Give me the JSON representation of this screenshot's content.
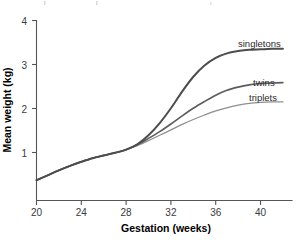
{
  "chart_data": {
    "type": "line",
    "title": "",
    "xlabel": "Gestation (weeks)",
    "ylabel": "Mean weight (kg)",
    "xlim": [
      20,
      42.5
    ],
    "ylim": [
      0,
      4
    ],
    "xticks": [
      20,
      24,
      28,
      32,
      36,
      40
    ],
    "yticks": [
      1,
      2,
      3,
      4
    ],
    "xtick_labels": [
      "20",
      "24",
      "28",
      "32",
      "36",
      "40"
    ],
    "ytick_labels": [
      "1",
      "2",
      "3",
      "4"
    ],
    "grid": false,
    "legend_position": "inline-right",
    "x": [
      20,
      21,
      22,
      23,
      24,
      25,
      26,
      27,
      28,
      29,
      30,
      31,
      32,
      33,
      34,
      35,
      36,
      37,
      38,
      39,
      40,
      41,
      42
    ],
    "series": [
      {
        "name": "singletons",
        "label": "singletons",
        "color": "#4d4d4d",
        "width": 2.0,
        "values": [
          0.45,
          0.56,
          0.67,
          0.77,
          0.86,
          0.94,
          1.0,
          1.06,
          1.13,
          1.25,
          1.45,
          1.72,
          2.05,
          2.42,
          2.75,
          3.0,
          3.17,
          3.27,
          3.32,
          3.35,
          3.36,
          3.37,
          3.37
        ]
      },
      {
        "name": "twins",
        "label": "twins",
        "color": "#5c5c5c",
        "width": 1.6,
        "values": [
          0.45,
          0.56,
          0.67,
          0.77,
          0.86,
          0.94,
          1.0,
          1.06,
          1.13,
          1.24,
          1.38,
          1.53,
          1.7,
          1.88,
          2.05,
          2.2,
          2.34,
          2.45,
          2.52,
          2.57,
          2.6,
          2.61,
          2.62
        ]
      },
      {
        "name": "triplets",
        "label": "triplets",
        "color": "#8f8f8f",
        "width": 1.3,
        "values": [
          0.45,
          0.56,
          0.67,
          0.77,
          0.86,
          0.94,
          1.0,
          1.06,
          1.13,
          1.22,
          1.33,
          1.45,
          1.57,
          1.69,
          1.8,
          1.9,
          1.99,
          2.06,
          2.12,
          2.16,
          2.18,
          2.19,
          2.19
        ]
      }
    ]
  },
  "axis": {
    "x_title": "Gestation (weeks)",
    "y_title": "Mean weight (kg)"
  },
  "labels": {
    "singletons": "singletons",
    "twins": "twins",
    "triplets": "triplets"
  },
  "ticks": {
    "x0": "20",
    "x1": "24",
    "x2": "28",
    "x3": "32",
    "x4": "36",
    "x5": "40",
    "y1": "1",
    "y2": "2",
    "y3": "3",
    "y4": "4"
  },
  "colors": {
    "singletons": "#4d4d4d",
    "twins": "#5c5c5c",
    "triplets": "#8f8f8f",
    "axis": "#555555",
    "text": "#1a1a1a",
    "background": "#ffffff"
  }
}
